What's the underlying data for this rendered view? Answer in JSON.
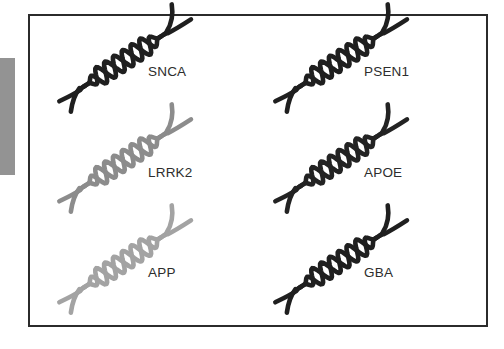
{
  "figure": {
    "background_color": "#ffffff",
    "panel": {
      "border_color": "#2b2b2b",
      "fill_color": "#ffffff"
    },
    "edge_marker": {
      "name": "left-edge-marker",
      "color": "#939393"
    },
    "icon_name": "dna-double-helix-icon",
    "layout": {
      "columns": 2,
      "rows": 3
    },
    "genes": [
      {
        "label": "SNCA",
        "color": "#1f1f1f",
        "icon": "dna-double-helix-icon"
      },
      {
        "label": "PSEN1",
        "color": "#1f1f1f",
        "icon": "dna-double-helix-icon"
      },
      {
        "label": "LRRK2",
        "color": "#8c8c8c",
        "icon": "dna-double-helix-icon"
      },
      {
        "label": "APOE",
        "color": "#232323",
        "icon": "dna-double-helix-icon"
      },
      {
        "label": "APP",
        "color": "#a3a3a3",
        "icon": "dna-double-helix-icon"
      },
      {
        "label": "GBA",
        "color": "#1f1f1f",
        "icon": "dna-double-helix-icon"
      }
    ]
  }
}
